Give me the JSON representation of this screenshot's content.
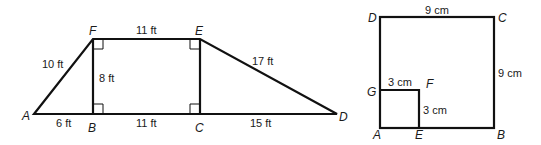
{
  "figures": [
    {
      "name": "trapezoid-figure",
      "points": {
        "A": {
          "label": "A",
          "x": 34,
          "y": 114
        },
        "B": {
          "label": "B",
          "x": 93,
          "y": 114
        },
        "C": {
          "label": "C",
          "x": 200,
          "y": 114
        },
        "D": {
          "label": "D",
          "x": 337,
          "y": 114
        },
        "E": {
          "label": "E",
          "x": 200,
          "y": 39
        },
        "F": {
          "label": "F",
          "x": 93,
          "y": 39
        }
      },
      "measurements": {
        "AF": "10 ft",
        "FE": "11 ft",
        "ED": "17 ft",
        "FB": "8 ft",
        "AB": "6 ft",
        "BC": "11 ft",
        "CD": "15 ft"
      }
    },
    {
      "name": "squares-figure",
      "points": {
        "A": {
          "label": "A",
          "x": 380,
          "y": 128
        },
        "B": {
          "label": "B",
          "x": 494,
          "y": 128
        },
        "C": {
          "label": "C",
          "x": 494,
          "y": 17
        },
        "D": {
          "label": "D",
          "x": 380,
          "y": 17
        },
        "E": {
          "label": "E",
          "x": 419,
          "y": 128
        },
        "F": {
          "label": "F",
          "x": 419,
          "y": 90
        },
        "G": {
          "label": "G",
          "x": 380,
          "y": 90
        }
      },
      "measurements": {
        "DC": "9 cm",
        "CB": "9 cm",
        "GF": "3 cm",
        "FE": "3 cm"
      }
    }
  ]
}
